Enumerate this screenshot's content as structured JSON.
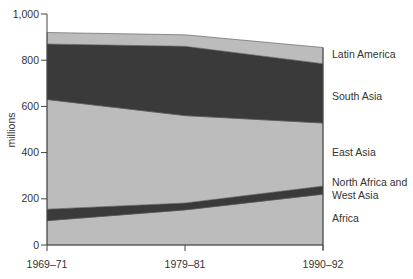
{
  "chart_data": {
    "type": "area",
    "stacked": true,
    "title": "",
    "xlabel": "",
    "ylabel": "millions",
    "ylim": [
      0,
      1000
    ],
    "yticks": [
      0,
      200,
      400,
      600,
      800,
      1000
    ],
    "ytick_labels": [
      "0",
      "200",
      "400",
      "600",
      "800",
      "1,000"
    ],
    "categories": [
      "1969–71",
      "1979–81",
      "1990–92"
    ],
    "grid": false,
    "legend_position": "right, inline labels",
    "series": [
      {
        "name": "Africa",
        "values": [
          105,
          152,
          220
        ],
        "color": "#bcbcbc"
      },
      {
        "name": "North Africa and West Asia",
        "values": [
          50,
          30,
          35
        ],
        "color": "#3a3a3a"
      },
      {
        "name": "East Asia",
        "values": [
          475,
          378,
          273
        ],
        "color": "#bcbcbc"
      },
      {
        "name": "South Asia",
        "values": [
          240,
          300,
          257
        ],
        "color": "#3a3a3a"
      },
      {
        "name": "Latin America",
        "values": [
          50,
          50,
          70
        ],
        "color": "#bcbcbc"
      }
    ]
  },
  "labels": {
    "ylabel": "millions",
    "legend": [
      {
        "lines": [
          "Latin America"
        ],
        "y": 58
      },
      {
        "lines": [
          "South Asia"
        ],
        "y": 100
      },
      {
        "lines": [
          "East Asia"
        ],
        "y": 156
      },
      {
        "lines": [
          "North Africa and",
          "West Asia"
        ],
        "y": 186
      },
      {
        "lines": [
          "Africa"
        ],
        "y": 222
      }
    ]
  }
}
